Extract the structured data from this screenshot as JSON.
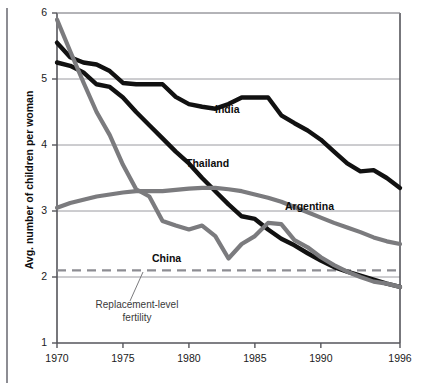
{
  "chart_data": {
    "type": "line",
    "title": "",
    "xlabel": "",
    "ylabel": "Avg. number of children per woman",
    "xlim": [
      1970,
      1996
    ],
    "ylim": [
      1,
      6
    ],
    "grid": true,
    "legend_position": "inline-labels",
    "x_ticks": [
      "1970",
      "1975",
      "1980",
      "1985",
      "1990",
      "1996"
    ],
    "x_tick_values": [
      1970,
      1975,
      1980,
      1985,
      1990,
      1996
    ],
    "y_ticks": [
      "1",
      "2",
      "3",
      "4",
      "5",
      "6"
    ],
    "y_tick_values": [
      1,
      2,
      3,
      4,
      5,
      6
    ],
    "x": [
      1970,
      1971,
      1972,
      1973,
      1974,
      1975,
      1976,
      1977,
      1978,
      1979,
      1980,
      1981,
      1982,
      1983,
      1984,
      1985,
      1986,
      1987,
      1988,
      1989,
      1990,
      1991,
      1992,
      1993,
      1994,
      1995,
      1996
    ],
    "series": [
      {
        "name": "India",
        "color": "#111111",
        "style": "solid",
        "width": 4.4,
        "values": [
          5.55,
          5.33,
          5.25,
          5.22,
          5.12,
          4.94,
          4.92,
          4.92,
          4.92,
          4.73,
          4.62,
          4.58,
          4.55,
          4.62,
          4.72,
          4.72,
          4.72,
          4.45,
          4.33,
          4.22,
          4.08,
          3.9,
          3.72,
          3.6,
          3.62,
          3.5,
          3.35
        ]
      },
      {
        "name": "Thailand",
        "color": "#111111",
        "style": "solid",
        "width": 4.4,
        "values": [
          5.25,
          5.2,
          5.1,
          4.92,
          4.88,
          4.72,
          4.5,
          4.3,
          4.1,
          3.9,
          3.72,
          3.5,
          3.3,
          3.1,
          2.92,
          2.88,
          2.72,
          2.58,
          2.48,
          2.36,
          2.25,
          2.15,
          2.08,
          2.02,
          1.96,
          1.9,
          1.85
        ]
      },
      {
        "name": "China",
        "color": "#7b7b7e",
        "style": "solid",
        "width": 4.2,
        "values": [
          5.9,
          5.42,
          4.95,
          4.5,
          4.15,
          3.7,
          3.33,
          3.22,
          2.85,
          2.78,
          2.72,
          2.78,
          2.62,
          2.28,
          2.5,
          2.62,
          2.82,
          2.8,
          2.56,
          2.45,
          2.3,
          2.18,
          2.08,
          2.0,
          1.93,
          1.9,
          1.85
        ]
      },
      {
        "name": "Argentina",
        "color": "#7b7b7e",
        "style": "solid",
        "width": 4.2,
        "values": [
          3.05,
          3.12,
          3.17,
          3.22,
          3.25,
          3.28,
          3.3,
          3.3,
          3.3,
          3.32,
          3.34,
          3.35,
          3.35,
          3.33,
          3.3,
          3.25,
          3.2,
          3.14,
          3.06,
          2.98,
          2.9,
          2.82,
          2.75,
          2.68,
          2.6,
          2.54,
          2.5
        ]
      }
    ],
    "reference_line": {
      "label": "Replacement-level fertility",
      "value": 2.1,
      "style": "dashed",
      "color": "#8d8d93"
    },
    "series_label_positions": [
      {
        "name": "India",
        "x": 215,
        "y": 103
      },
      {
        "name": "Thailand",
        "x": 186,
        "y": 157
      },
      {
        "name": "Argentina",
        "x": 285,
        "y": 200
      },
      {
        "name": "China",
        "x": 152,
        "y": 252
      }
    ]
  }
}
